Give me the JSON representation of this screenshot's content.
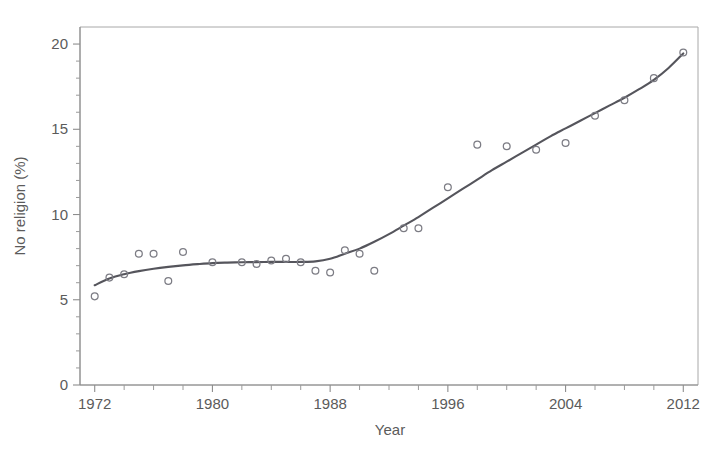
{
  "figure": {
    "background_color": "#ffffff",
    "axis_color": "#8d8d8d",
    "point_color": "#7c7c84",
    "line_color": "#55555c"
  },
  "axes": {
    "x_title": "Year",
    "y_title": "No religion (%)",
    "x_tick_labels": [
      "1972",
      "1980",
      "1988",
      "1996",
      "2004",
      "2012"
    ],
    "y_tick_labels": [
      "0",
      "5",
      "10",
      "15",
      "20"
    ]
  },
  "chart_data": {
    "type": "scatter",
    "title": "",
    "xlabel": "Year",
    "ylabel": "No religion (%)",
    "xlim": [
      1971,
      2013
    ],
    "ylim": [
      0,
      21
    ],
    "grid": false,
    "legend": "none",
    "x_ticks": [
      1972,
      1980,
      1988,
      1996,
      2004,
      2012
    ],
    "x_minor_tick_step": 2,
    "y_ticks": [
      0,
      5,
      10,
      15,
      20
    ],
    "series": [
      {
        "name": "No religion (%) — GSS observations",
        "type": "scatter",
        "marker": "open-circle",
        "x": [
          1972,
          1973,
          1974,
          1975,
          1976,
          1977,
          1978,
          1980,
          1982,
          1983,
          1984,
          1985,
          1986,
          1987,
          1988,
          1989,
          1990,
          1991,
          1993,
          1994,
          1996,
          1998,
          2000,
          2002,
          2004,
          2006,
          2008,
          2010,
          2012
        ],
        "y": [
          5.2,
          6.3,
          6.5,
          7.7,
          7.7,
          6.1,
          7.8,
          7.2,
          7.2,
          7.1,
          7.3,
          7.4,
          7.2,
          6.7,
          6.6,
          7.9,
          7.7,
          6.7,
          9.2,
          9.2,
          11.6,
          14.1,
          14.0,
          13.8,
          14.2,
          15.8,
          16.7,
          18.0,
          19.5
        ]
      },
      {
        "name": "Smoothed trend",
        "type": "line",
        "x": [
          1972,
          1973,
          1974,
          1975,
          1976,
          1977,
          1978,
          1979,
          1980,
          1981,
          1982,
          1983,
          1984,
          1985,
          1986,
          1987,
          1988,
          1989,
          1990,
          1991,
          1992,
          1993,
          1994,
          1995,
          1996,
          1997,
          1998,
          1999,
          2000,
          2001,
          2002,
          2003,
          2004,
          2005,
          2006,
          2007,
          2008,
          2009,
          2010,
          2011,
          2012
        ],
        "y": [
          5.85,
          6.25,
          6.5,
          6.68,
          6.82,
          6.93,
          7.02,
          7.09,
          7.15,
          7.18,
          7.2,
          7.21,
          7.22,
          7.22,
          7.22,
          7.25,
          7.4,
          7.7,
          8.0,
          8.4,
          8.85,
          9.35,
          9.85,
          10.4,
          10.95,
          11.5,
          12.05,
          12.6,
          13.1,
          13.6,
          14.1,
          14.6,
          15.05,
          15.5,
          15.95,
          16.4,
          16.85,
          17.35,
          17.9,
          18.6,
          19.45
        ]
      }
    ]
  }
}
